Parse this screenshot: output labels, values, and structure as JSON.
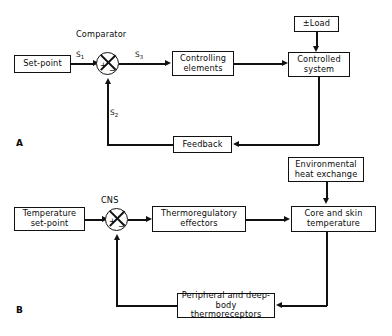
{
  "figure": {
    "type": "block-diagram",
    "line_color": "#111111",
    "background": "#ffffff"
  },
  "panel_a": {
    "label": "A",
    "blocks": {
      "set_point": "Set-point",
      "controlling_elements": "Controlling\nelements",
      "controlled_system": "Controlled\nsystem",
      "load": "±Load",
      "feedback": "Feedback"
    },
    "junction": {
      "title": "Comparator",
      "plus": "+",
      "minus": "−"
    },
    "signals": {
      "input": "S",
      "input_sub": "1",
      "error": "S",
      "error_sub": "3",
      "feedback": "S",
      "feedback_sub": "2"
    }
  },
  "panel_b": {
    "label": "B",
    "blocks": {
      "set_point": "Temperature\nset-point",
      "effectors": "Thermoregulatory\neffectors",
      "controlled_system": "Core and skin\ntemperature",
      "load": "Environmental\nheat exchange",
      "feedback": "Peripheral and deep-body\nthermoreceptors"
    },
    "junction": {
      "title": "CNS",
      "plus": "+",
      "minus": "−"
    }
  }
}
